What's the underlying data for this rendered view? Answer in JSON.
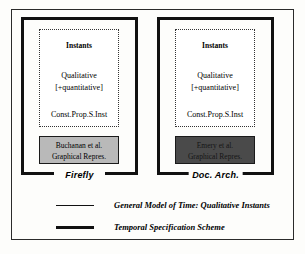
{
  "figure": {
    "systems": [
      {
        "id": "firefly",
        "name": "Firefly",
        "model": {
          "instants": "Instants",
          "qualitative": "Qualitative",
          "quantitative": "[+quantitative]",
          "constraint": "Const.Prop.S.Inst"
        },
        "implementation": {
          "author": "Buchanan et al.",
          "representation": "Graphical Repres.",
          "fill": "#b9b9b9"
        }
      },
      {
        "id": "doc-arch",
        "name": "Doc. Arch.",
        "model": {
          "instants": "Instants",
          "qualitative": "Qualitative",
          "quantitative": "[+quantitative]",
          "constraint": "Const.Prop.S.Inst"
        },
        "implementation": {
          "author": "Emery et al.",
          "representation": "Graphical Repres.",
          "fill": "#4a4a4a"
        }
      }
    ],
    "legend": [
      {
        "style": "thin",
        "label": "General Model of Time: Qualitative Instants"
      },
      {
        "style": "thick",
        "label": "Temporal Specification Scheme"
      }
    ]
  }
}
